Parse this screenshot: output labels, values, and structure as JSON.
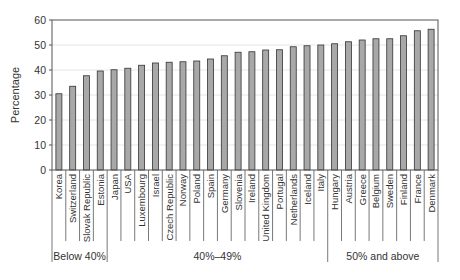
{
  "chart_data": {
    "type": "bar",
    "title": "",
    "xlabel": "",
    "ylabel": "Percentage",
    "ylim": [
      0,
      60
    ],
    "yticks": [
      0,
      10,
      20,
      30,
      40,
      50,
      60
    ],
    "grid": true,
    "legend": null,
    "bar_color": "#a8a8a8",
    "bar_edge_color": "#333333",
    "categories": [
      "Korea",
      "Switzerland",
      "Slovak Republic",
      "Estonia",
      "Japan",
      "USA",
      "Luxembourg",
      "Israel",
      "Czech Republic",
      "Norway",
      "Poland",
      "Spain",
      "Germany",
      "Slovenia",
      "Ireland",
      "United Kingdom",
      "Portugal",
      "Netherlands",
      "Iceland",
      "Italy",
      "Hungary",
      "Austria",
      "Greece",
      "Belgium",
      "Sweden",
      "Finland",
      "France",
      "Denmark"
    ],
    "values": [
      30.5,
      33.5,
      37.7,
      39.6,
      40.1,
      40.7,
      41.9,
      42.8,
      43.1,
      43.3,
      43.6,
      44.4,
      45.7,
      47.1,
      47.3,
      48.0,
      48.1,
      49.3,
      49.7,
      50.0,
      50.5,
      51.3,
      52.0,
      52.5,
      52.5,
      53.7,
      55.7,
      56.3
    ],
    "groups": [
      {
        "label": "Below 40%",
        "start": 0,
        "end": 3
      },
      {
        "label": "40%–49%",
        "start": 4,
        "end": 19
      },
      {
        "label": "50% and above",
        "start": 20,
        "end": 27
      }
    ]
  }
}
